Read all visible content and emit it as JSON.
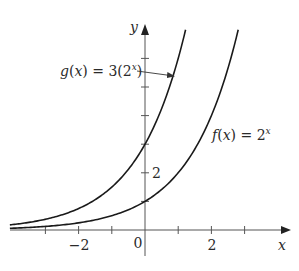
{
  "chart_data": {
    "type": "line",
    "title": "",
    "xlabel": "x",
    "ylabel": "y",
    "xlim": [
      -4.1,
      4.4
    ],
    "ylim": [
      -0.8,
      7.3
    ],
    "grid": false,
    "legend_position": "inline labels",
    "x_ticks": [
      -3,
      -2,
      -1,
      1,
      2,
      3
    ],
    "x_tick_labels": [
      {
        "value": -2,
        "text": "−2"
      },
      {
        "value": 0,
        "text": "0"
      },
      {
        "value": 2,
        "text": "2"
      }
    ],
    "y_ticks": [
      1,
      2,
      3,
      4,
      5,
      6
    ],
    "y_tick_labels": [
      {
        "value": 2,
        "text": "2"
      }
    ],
    "series": [
      {
        "name": "g(x) = 3(2^x)",
        "formula": "3*2^x",
        "x": [
          -4,
          -3,
          -2,
          -1,
          0,
          1,
          1.22
        ],
        "values": [
          0.1875,
          0.375,
          0.75,
          1.5,
          3,
          6,
          7.0
        ]
      },
      {
        "name": "f(x) = 2^x",
        "formula": "2^x",
        "x": [
          -4,
          -3,
          -2,
          -1,
          0,
          1,
          2,
          2.8
        ],
        "values": [
          0.0625,
          0.125,
          0.25,
          0.5,
          1,
          2,
          4,
          7.0
        ]
      }
    ],
    "annotations": [
      {
        "text_parts": [
          "g",
          "(",
          "x",
          ") = 3(2",
          "x",
          ")"
        ],
        "points_to": "g(x) = 3(2^x)",
        "arrow": true
      },
      {
        "text_parts": [
          "f",
          "(",
          "x",
          ") = 2",
          "x"
        ],
        "points_to": "f(x) = 2^x",
        "arrow": false
      }
    ]
  },
  "labels": {
    "x_axis": "x",
    "y_axis": "y",
    "tick_neg2": "−2",
    "tick_zero": "0",
    "tick_pos2": "2",
    "tick_y2": "2",
    "g_label_name": "g",
    "g_label_paren_open": "(",
    "g_label_var": "x",
    "g_label_rest": ") = 3(2",
    "g_label_exp": "x",
    "g_label_close": ")",
    "f_label_name": "f",
    "f_label_paren_open": "(",
    "f_label_var": "x",
    "f_label_rest": ") = 2",
    "f_label_exp": "x"
  },
  "colors": {
    "curve": "#1a1a1a",
    "axis": "#555555",
    "text": "#2a2a2a",
    "background": "#ffffff"
  }
}
